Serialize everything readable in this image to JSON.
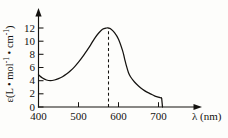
{
  "figure": {
    "background_color": "#fdfdfb",
    "line_color": "#14120f"
  },
  "axes": {
    "y_axis_label": "ε(L • mol⁻¹ • cm⁻¹)",
    "y_axis_label_parts": {
      "epsilon": "ε(L • mol",
      "exp1": "-1",
      "mid": " • cm",
      "exp2": "-1",
      "close": ")"
    },
    "x_axis_label": "λ (nm)",
    "x_axis_symbol": "λ",
    "x_axis_unit": "(nm)",
    "y_ticks": [
      "0",
      "2",
      "4",
      "6",
      "8",
      "10",
      "12"
    ],
    "x_ticks": [
      "400",
      "500",
      "600",
      "700"
    ]
  },
  "annotations": {
    "peak_guide_label": "",
    "peak_guide_wavelength": 575
  },
  "chart_data": {
    "type": "line",
    "title": "",
    "xlabel": "λ (nm)",
    "ylabel": "ε(L • mol⁻¹ • cm⁻¹)",
    "xlim": [
      400,
      730
    ],
    "ylim": [
      0,
      13
    ],
    "xticks": [
      400,
      500,
      600,
      700
    ],
    "yticks": [
      0,
      2,
      4,
      6,
      8,
      10,
      12
    ],
    "grid": false,
    "legend": null,
    "annotations": [
      {
        "type": "vertical-dashed-line",
        "x": 575,
        "y_from": 0,
        "y_to": 12,
        "note": "dashed line marking absorption maximum"
      }
    ],
    "series": [
      {
        "name": "absorptivity",
        "x": [
          400,
          410,
          420,
          430,
          440,
          450,
          460,
          470,
          480,
          490,
          500,
          510,
          520,
          530,
          540,
          550,
          560,
          570,
          575,
          580,
          590,
          600,
          610,
          615,
          620,
          625,
          630,
          640,
          650,
          660,
          670,
          680,
          690,
          700,
          705,
          708,
          710
        ],
        "y": [
          4.9,
          4.4,
          4.1,
          4.0,
          4.1,
          4.3,
          4.6,
          5.0,
          5.5,
          6.1,
          6.8,
          7.6,
          8.5,
          9.4,
          10.4,
          11.2,
          11.8,
          12.0,
          12.0,
          11.9,
          11.3,
          10.3,
          8.6,
          7.4,
          6.2,
          5.2,
          4.6,
          3.8,
          3.2,
          2.7,
          2.3,
          2.0,
          1.7,
          1.5,
          1.4,
          1.3,
          0.0
        ]
      }
    ]
  }
}
